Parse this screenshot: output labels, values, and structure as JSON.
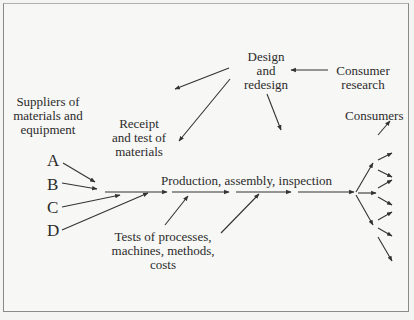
{
  "diagram": {
    "type": "flow-diagram",
    "nodes": {
      "design": {
        "line1": "Design",
        "line2": "and",
        "line3": "redesign"
      },
      "consumer_research": {
        "line1": "Consumer",
        "line2": "research"
      },
      "suppliers": {
        "line1": "Suppliers of",
        "line2": "materials and",
        "line3": "equipment"
      },
      "receipt": {
        "line1": "Receipt",
        "line2": "and test of",
        "line3": "materials"
      },
      "production": {
        "label": "Production, assembly, inspection"
      },
      "tests": {
        "line1": "Tests of processes,",
        "line2": "machines, methods,",
        "line3": "costs"
      },
      "consumers": {
        "label": "Consumers"
      }
    },
    "suppliers_list": [
      "A",
      "B",
      "C",
      "D"
    ],
    "edges": [
      {
        "from": "Consumer research",
        "to": "Design and redesign"
      },
      {
        "from": "Design and redesign",
        "to": "Suppliers of materials and equipment"
      },
      {
        "from": "Design and redesign",
        "to": "Receipt and test of materials"
      },
      {
        "from": "Design and redesign",
        "to": "Production, assembly, inspection"
      },
      {
        "from": "A",
        "to": "Production line"
      },
      {
        "from": "B",
        "to": "Production line"
      },
      {
        "from": "C",
        "to": "Production line"
      },
      {
        "from": "D",
        "to": "Production line"
      },
      {
        "from": "Receipt and test of materials",
        "to": "Production line"
      },
      {
        "from": "Tests of processes, machines, methods, costs",
        "to": "Production line"
      },
      {
        "from": "Production, assembly, inspection",
        "to": "Consumers"
      }
    ],
    "colors": {
      "line": "#333333",
      "background": "#f7f7f5",
      "border": "#8a8a8a"
    }
  }
}
